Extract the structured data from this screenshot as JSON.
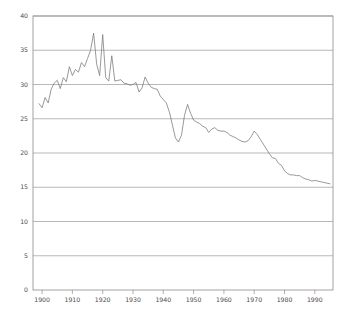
{
  "chart_data": {
    "type": "line",
    "title": "",
    "subtitle": "",
    "xlabel": "",
    "ylabel": "",
    "xlim": [
      1897,
      1996
    ],
    "ylim": [
      0,
      40
    ],
    "grid": true,
    "grid_axis": "y",
    "legend": false,
    "legend_position": "none",
    "line_color": "#777777",
    "grid_color": "#9a9a9a",
    "frame_color": "#8c8c8c",
    "text_color": "#4a4a4a",
    "background_color": "#ffffff",
    "yticks": [
      0,
      5,
      10,
      15,
      20,
      25,
      30,
      35,
      40
    ],
    "ytick_labels": [
      "0",
      "5",
      "10",
      "15",
      "20",
      "25",
      "30",
      "35",
      "40"
    ],
    "xticks": [
      1900,
      1910,
      1920,
      1930,
      1940,
      1950,
      1960,
      1970,
      1980,
      1990
    ],
    "xtick_labels": [
      "1900",
      "1910",
      "1920",
      "1930",
      "1940",
      "1950",
      "1960",
      "1970",
      "1980",
      "1990"
    ],
    "series": [
      {
        "name": "rate",
        "color": "#777777",
        "x": [
          1899,
          1900,
          1901,
          1902,
          1903,
          1904,
          1905,
          1906,
          1907,
          1908,
          1909,
          1910,
          1911,
          1912,
          1913,
          1914,
          1915,
          1916,
          1917,
          1918,
          1919,
          1920,
          1921,
          1922,
          1923,
          1924,
          1925,
          1926,
          1927,
          1928,
          1929,
          1930,
          1931,
          1932,
          1933,
          1934,
          1935,
          1936,
          1937,
          1938,
          1939,
          1940,
          1941,
          1942,
          1943,
          1944,
          1945,
          1946,
          1947,
          1948,
          1949,
          1950,
          1951,
          1952,
          1953,
          1954,
          1955,
          1956,
          1957,
          1958,
          1959,
          1960,
          1961,
          1962,
          1963,
          1964,
          1965,
          1966,
          1967,
          1968,
          1969,
          1970,
          1971,
          1972,
          1973,
          1974,
          1975,
          1976,
          1977,
          1978,
          1979,
          1980,
          1981,
          1982,
          1983,
          1984,
          1985,
          1986,
          1987,
          1988,
          1989,
          1990,
          1991,
          1992,
          1993,
          1994,
          1995
        ],
        "y": [
          27.2,
          26.6,
          28.1,
          27.3,
          29.3,
          30.2,
          30.6,
          29.4,
          31.0,
          30.4,
          32.6,
          31.3,
          32.2,
          31.8,
          33.2,
          32.6,
          33.8,
          35.0,
          37.5,
          33.0,
          31.3,
          37.3,
          31.0,
          30.5,
          34.2,
          30.5,
          30.6,
          30.7,
          30.2,
          30.1,
          29.9,
          30.0,
          30.3,
          28.9,
          29.5,
          31.1,
          30.2,
          29.6,
          29.4,
          29.3,
          28.3,
          27.8,
          27.3,
          26.0,
          24.1,
          22.2,
          21.6,
          22.6,
          25.5,
          27.1,
          25.8,
          24.8,
          24.5,
          24.3,
          23.9,
          23.7,
          23.0,
          23.5,
          23.7,
          23.3,
          23.2,
          23.2,
          23.0,
          22.6,
          22.4,
          22.2,
          21.9,
          21.7,
          21.6,
          21.8,
          22.4,
          23.2,
          22.7,
          22.0,
          21.3,
          20.6,
          19.9,
          19.3,
          19.2,
          18.5,
          18.2,
          17.4,
          17.0,
          16.8,
          16.8,
          16.7,
          16.7,
          16.4,
          16.2,
          16.1,
          15.9,
          16.0,
          15.9,
          15.8,
          15.7,
          15.6,
          15.5
        ]
      }
    ]
  },
  "axes": {
    "plot_left": 33,
    "plot_right": 333,
    "plot_top": 16,
    "plot_bottom": 290
  }
}
